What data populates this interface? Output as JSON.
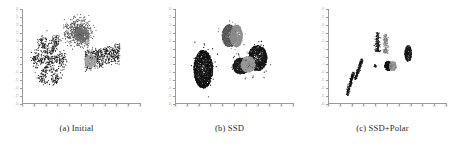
{
  "figure": {
    "panel_count": 3,
    "background_color": "#ffffff",
    "axis_color": "#9a9a9a",
    "tick_label_color": "#b3b3b3",
    "caption_color": "#2b2b2b"
  },
  "panels": [
    {
      "id": "panel-a",
      "caption": "(a) Initial",
      "chart_index": 0
    },
    {
      "id": "panel-b",
      "caption": "(b) SSD",
      "chart_index": 1
    },
    {
      "id": "panel-c",
      "caption": "(c) SSD+Polar",
      "chart_index": 2
    }
  ],
  "chart_data": [
    {
      "type": "scatter",
      "title": "(a) Initial",
      "xlabel": "",
      "ylabel": "",
      "xlim": [
        -50,
        50
      ],
      "ylim": [
        -30,
        30
      ],
      "xticks": [
        -50,
        -40,
        -30,
        -20,
        -10,
        0,
        10,
        20,
        30,
        40,
        50
      ],
      "xticklabels": [
        "-50",
        "-40",
        "-30",
        "-20",
        "-10",
        "0",
        "10",
        "20",
        "30",
        "40",
        "50"
      ],
      "yticks": [
        -30,
        -25,
        -20,
        -15,
        -10,
        -5,
        0,
        5,
        10,
        15,
        20,
        25,
        30
      ],
      "yticklabels": [
        "-30",
        "-25",
        "-20",
        "-15",
        "-10",
        "-5",
        "0",
        "5",
        "10",
        "15",
        "20",
        "25",
        "30"
      ],
      "grid": false,
      "legend": null,
      "marker": "dot",
      "marker_size": 0.55,
      "description": "Unregistered point clouds overlap as diffuse filamentary tendrils; three groups partially intermingle near the origin.",
      "series": [
        {
          "name": "cluster-1-black",
          "color": "#111111",
          "center": [
            -27,
            -2
          ],
          "n_points": 620,
          "shape": "radial-star-filaments",
          "spread": [
            14,
            16
          ]
        },
        {
          "name": "cluster-2-darkgray",
          "color": "#4a4a4a",
          "center": [
            -2,
            15
          ],
          "n_points": 560,
          "shape": "branching-tendrils",
          "spread": [
            12,
            9
          ]
        },
        {
          "name": "cluster-3-midgray",
          "color": "#6e6e6e",
          "center": [
            1,
            14
          ],
          "n_points": 300,
          "shape": "compact-lobe",
          "spread": [
            6,
            5
          ]
        },
        {
          "name": "cluster-4-black-right",
          "color": "#1a1a1a",
          "center": [
            18,
            0
          ],
          "n_points": 520,
          "shape": "horizontal-streaks",
          "spread": [
            15,
            6
          ]
        },
        {
          "name": "cluster-5-lightgray",
          "color": "#a5a5a5",
          "center": [
            8,
            -3
          ],
          "n_points": 260,
          "shape": "compact-patch",
          "spread": [
            5,
            4
          ]
        }
      ]
    },
    {
      "type": "scatter",
      "title": "(b) SSD",
      "xlabel": "",
      "ylabel": "",
      "xlim": [
        -50,
        50
      ],
      "ylim": [
        -30,
        30
      ],
      "xticks": [
        -50,
        -40,
        -30,
        -20,
        -10,
        0,
        10,
        20,
        30,
        40,
        50
      ],
      "xticklabels": [
        "-50",
        "-40",
        "-30",
        "-20",
        "-10",
        "0",
        "10",
        "20",
        "30",
        "40",
        "50"
      ],
      "yticks": [
        -30,
        -25,
        -20,
        -15,
        -10,
        -5,
        0,
        5,
        10,
        15,
        20,
        25,
        30
      ],
      "yticklabels": [
        "-30",
        "-25",
        "-20",
        "-15",
        "-10",
        "-5",
        "0",
        "5",
        "10",
        "15",
        "20",
        "25",
        "30"
      ],
      "grid": false,
      "legend": null,
      "marker": "dot",
      "marker_size": 0.6,
      "description": "After SSD registration the points collapse into three dense blobs; each blob still shows two-tone shading indicating residual misalignment between sub-populations.",
      "series": [
        {
          "name": "blob-left-black",
          "color": "#101010",
          "center": [
            -26,
            -8
          ],
          "n_points": 1400,
          "shape": "dense-ellipse",
          "spread": [
            8,
            12
          ]
        },
        {
          "name": "blob-top-darkgray",
          "color": "#555555",
          "center": [
            -4,
            13
          ],
          "n_points": 700,
          "shape": "dense-lobe",
          "spread": [
            6,
            7
          ]
        },
        {
          "name": "blob-top-lightgray",
          "color": "#8d8d8d",
          "center": [
            2,
            13
          ],
          "n_points": 620,
          "shape": "dense-lobe",
          "spread": [
            5,
            7
          ]
        },
        {
          "name": "blob-right-black",
          "color": "#151515",
          "center": [
            20,
            -1
          ],
          "n_points": 1000,
          "shape": "dense-ellipse",
          "spread": [
            8,
            8
          ]
        },
        {
          "name": "blob-center-black",
          "color": "#1a1a1a",
          "center": [
            6,
            -6
          ],
          "n_points": 650,
          "shape": "dense-lobe",
          "spread": [
            7,
            5
          ]
        },
        {
          "name": "blob-center-lightgray",
          "color": "#9a9a9a",
          "center": [
            12,
            -5
          ],
          "n_points": 520,
          "shape": "dense-lobe",
          "spread": [
            6,
            5
          ]
        }
      ]
    },
    {
      "type": "scatter",
      "title": "(c) SSD+Polar",
      "xlabel": "",
      "ylabel": "",
      "xlim": [
        -50,
        50
      ],
      "ylim": [
        -30,
        30
      ],
      "xticks": [
        -50,
        -40,
        -30,
        -20,
        -10,
        0,
        10,
        20,
        30,
        40,
        50
      ],
      "xticklabels": [
        "-50",
        "-40",
        "-30",
        "-20",
        "-10",
        "0",
        "10",
        "20",
        "30",
        "40",
        "50"
      ],
      "yticks": [
        -30,
        -25,
        -20,
        -15,
        -10,
        -5,
        0,
        5,
        10,
        15,
        20,
        25,
        30
      ],
      "yticklabels": [
        "-30",
        "-25",
        "-20",
        "-15",
        "-10",
        "-5",
        "0",
        "5",
        "10",
        "15",
        "20",
        "25",
        "30"
      ],
      "grid": false,
      "legend": null,
      "marker": "dot",
      "marker_size": 0.55,
      "description": "SSD combined with the polar term yields tight, well-separated elongated clusters with far lower scatter than SSD alone.",
      "series": [
        {
          "name": "sliver-far-left",
          "color": "#111111",
          "center": [
            -31,
            -17
          ],
          "n_points": 180,
          "shape": "thin-slanted-bar",
          "spread": [
            2,
            7
          ]
        },
        {
          "name": "sliver-left",
          "color": "#141414",
          "center": [
            -24,
            -8
          ],
          "n_points": 170,
          "shape": "thin-slanted-bar",
          "spread": [
            2,
            6
          ]
        },
        {
          "name": "sliver-upper-mid",
          "color": "#1a1a1a",
          "center": [
            -8,
            9
          ],
          "n_points": 150,
          "shape": "thin-vertical-bar",
          "spread": [
            2,
            6
          ]
        },
        {
          "name": "sliver-upper-gray",
          "color": "#7d7d7d",
          "center": [
            -1,
            8
          ],
          "n_points": 140,
          "shape": "thin-vertical-bar",
          "spread": [
            2,
            6
          ]
        },
        {
          "name": "dot-center",
          "color": "#222222",
          "center": [
            -10,
            -6
          ],
          "n_points": 25,
          "shape": "point",
          "spread": [
            1,
            1
          ]
        },
        {
          "name": "patch-center-black",
          "color": "#101010",
          "center": [
            1,
            -6
          ],
          "n_points": 220,
          "shape": "compact-blob",
          "spread": [
            3,
            3
          ]
        },
        {
          "name": "patch-center-gray",
          "color": "#8f8f8f",
          "center": [
            5,
            -6
          ],
          "n_points": 160,
          "shape": "compact-blob",
          "spread": [
            3,
            3
          ]
        },
        {
          "name": "patch-right-black",
          "color": "#121212",
          "center": [
            18,
            2
          ],
          "n_points": 260,
          "shape": "compact-blob",
          "spread": [
            3,
            5
          ]
        }
      ]
    }
  ]
}
